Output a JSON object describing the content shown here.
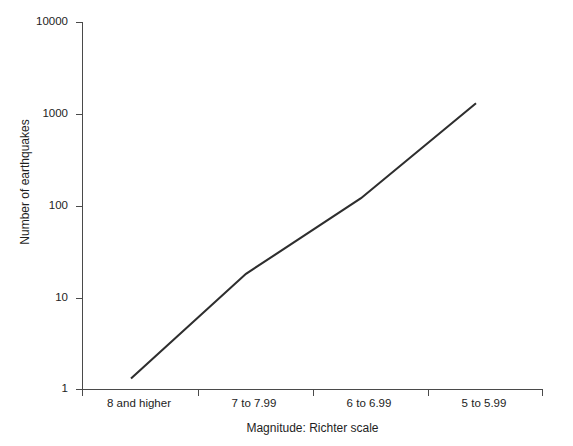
{
  "chart_data": {
    "type": "line",
    "title": "",
    "xlabel": "Magnitude: Richter scale",
    "ylabel": "Number of earthquakes",
    "categories": [
      "8 and higher",
      "7 to 7.99",
      "6 to 6.99",
      "5 to 5.99"
    ],
    "values": [
      1.3,
      18,
      120,
      1300
    ],
    "series": [
      {
        "name": "Number of earthquakes",
        "values": [
          1.3,
          18,
          120,
          1300
        ]
      }
    ],
    "yscale": "log",
    "ylim": [
      1,
      10000
    ],
    "ytick_labels": [
      "10000",
      "1000",
      "100",
      "10",
      "1"
    ],
    "ytick_values": [
      10000,
      1000,
      100,
      10,
      1
    ],
    "xtick_labels": [
      "8 and higher",
      "7 to 7.99",
      "6 to 6.99",
      "5 to 5.99"
    ],
    "grid": false,
    "legend": false,
    "line_color": "#2e2e2e",
    "axis_color": "#4a4a4a",
    "background": "#ffffff"
  },
  "axes": {
    "y": {
      "title": "Number of earthquakes",
      "ticks": [
        {
          "label": "10000",
          "value": 10000
        },
        {
          "label": "1000",
          "value": 1000
        },
        {
          "label": "100",
          "value": 100
        },
        {
          "label": "10",
          "value": 10
        },
        {
          "label": "1",
          "value": 1
        }
      ]
    },
    "x": {
      "title": "Magnitude: Richter scale",
      "ticks": [
        {
          "label": "8 and higher"
        },
        {
          "label": "7 to 7.99"
        },
        {
          "label": "6 to 6.99"
        },
        {
          "label": "5 to 5.99"
        }
      ]
    }
  }
}
